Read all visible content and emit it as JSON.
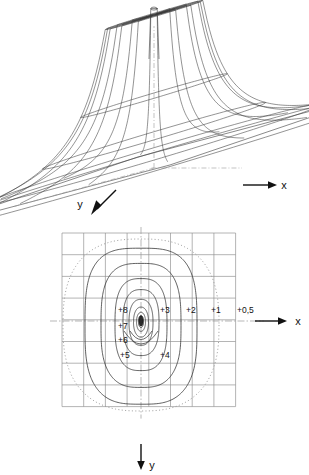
{
  "figure": {
    "title": "",
    "panels": [
      {
        "id": "surface",
        "type": "3d-surface-wireframe",
        "description": "Wireframe perspective plot of a rotationally-flared potential surface with a tall narrow singular spike at the origin, falling off to a flat base plane",
        "axes": {
          "x_label": "x",
          "y_label": "y",
          "x_arrow_direction": "right",
          "y_arrow_direction": "down-left"
        }
      },
      {
        "id": "contour",
        "type": "contour-map",
        "description": "Plan view contour map of the same surface, nested closed level curves around the central singularity on a square grid",
        "axes": {
          "x_label": "x",
          "y_label": "y",
          "x_arrow_direction": "right",
          "y_arrow_direction": "down"
        },
        "grid": {
          "columns": 8,
          "rows": 8
        }
      }
    ]
  },
  "chart_data": {
    "type": "line",
    "title": "",
    "subtitle": "",
    "xlabel": "x",
    "ylabel": "y",
    "grid": true,
    "legend": "none",
    "xlim": [
      -4,
      4
    ],
    "ylim": [
      -4,
      4
    ],
    "plot_kind": "contour-map-with-3d-surface",
    "annotations": [
      "Surface has a singular spike at the origin",
      "Contours are closed curves, elongated along y"
    ],
    "contour_levels": [
      {
        "label": "+0,5",
        "value": 0.5,
        "style": "dotted",
        "rx": 78,
        "ry": 86,
        "squareness": 2.6
      },
      {
        "label": "+1",
        "value": 1.0,
        "style": "solid",
        "rx": 56,
        "ry": 78,
        "squareness": 3.2
      },
      {
        "label": "+2",
        "value": 2.0,
        "style": "solid",
        "rx": 40,
        "ry": 62,
        "squareness": 3.0
      },
      {
        "label": "+3",
        "value": 3.0,
        "style": "solid",
        "rx": 26,
        "ry": 46,
        "squareness": 2.8
      },
      {
        "label": "+4",
        "value": 4.0,
        "style": "solid",
        "rx": 18,
        "ry": 33,
        "squareness": 2.6
      },
      {
        "label": "+5",
        "value": 5.0,
        "style": "solid",
        "rx": 12,
        "ry": 23,
        "squareness": 2.4
      },
      {
        "label": "+6",
        "value": 6.0,
        "style": "solid",
        "rx": 7.5,
        "ry": 15,
        "squareness": 2.2
      },
      {
        "label": "+7",
        "value": 7.0,
        "style": "solid",
        "rx": 4.5,
        "ry": 9.5,
        "squareness": 2.1
      },
      {
        "label": "+8",
        "value": 8.0,
        "style": "solid",
        "rx": 2.6,
        "ry": 6.0,
        "squareness": 2.0
      }
    ],
    "label_positions": [
      {
        "label": "+8",
        "x": 118,
        "y": 85,
        "anchor": "start"
      },
      {
        "label": "+7",
        "x": 118,
        "y": 101,
        "anchor": "start"
      },
      {
        "label": "+6",
        "x": 118,
        "y": 115,
        "anchor": "start"
      },
      {
        "label": "+5",
        "x": 120,
        "y": 130,
        "anchor": "start"
      },
      {
        "label": "+4",
        "x": 160,
        "y": 130,
        "anchor": "start"
      },
      {
        "label": "+3",
        "x": 160,
        "y": 85,
        "anchor": "start"
      },
      {
        "label": "+2",
        "x": 186,
        "y": 85,
        "anchor": "start"
      },
      {
        "label": "+1",
        "x": 211,
        "y": 85,
        "anchor": "start"
      },
      {
        "label": "+0,5",
        "x": 237,
        "y": 85,
        "anchor": "start"
      }
    ]
  },
  "labels": {
    "surface_x": "x",
    "surface_y": "y",
    "contour_x": "x",
    "contour_y": "y",
    "c05": "+0,5",
    "c1": "+1",
    "c2": "+2",
    "c3": "+3",
    "c4": "+4",
    "c5": "+5",
    "c6": "+6",
    "c7": "+7",
    "c8": "+8"
  },
  "colors": {
    "ink": "#1a1a1a",
    "mesh": "#3a3a3a",
    "grid": "#8c8c8c",
    "dotted_contour": "#9a9a9a",
    "axis_dashdot": "#9a9a9a",
    "background": "#ffffff"
  }
}
